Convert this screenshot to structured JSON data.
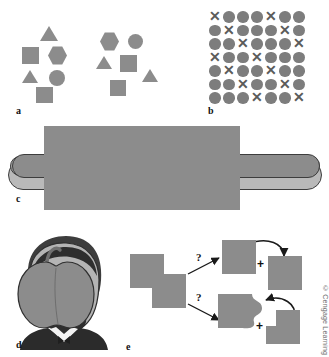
{
  "figure": {
    "credit": "© Cengage Learning",
    "shape_fill": "#8c8c8c",
    "outline": "#3d3d3d",
    "background": "#ffffff"
  },
  "panels": [
    {
      "id": "a",
      "label": "a",
      "name": "grouping-panel",
      "groups": [
        {
          "name": "left-cluster",
          "shapes": [
            "triangle",
            "square",
            "hexagon",
            "triangle",
            "circle",
            "square"
          ]
        },
        {
          "name": "right-cluster",
          "shapes": [
            "hexagon",
            "circle",
            "triangle",
            "square",
            "triangle",
            "square"
          ]
        }
      ]
    },
    {
      "id": "b",
      "label": "b",
      "name": "texture-segregation-panel",
      "grid": {
        "rows": 7,
        "cols": 7,
        "circle_symbol": "●",
        "cross_symbol": "✕",
        "cells": [
          [
            "X",
            "O",
            "O",
            "O",
            "X",
            "O",
            "O"
          ],
          [
            "O",
            "X",
            "O",
            "O",
            "O",
            "X",
            "O"
          ],
          [
            "O",
            "O",
            "X",
            "O",
            "O",
            "O",
            "X"
          ],
          [
            "X",
            "O",
            "O",
            "X",
            "O",
            "O",
            "O"
          ],
          [
            "O",
            "X",
            "O",
            "O",
            "X",
            "O",
            "O"
          ],
          [
            "O",
            "O",
            "X",
            "O",
            "O",
            "X",
            "O"
          ],
          [
            "O",
            "O",
            "O",
            "X",
            "O",
            "O",
            "X"
          ]
        ]
      }
    },
    {
      "id": "c",
      "label": "c",
      "name": "occlusion-hotdog-panel",
      "object": "hot-dog",
      "occluder": "gray-rectangle"
    },
    {
      "id": "d",
      "label": "d",
      "name": "occlusion-face-panel",
      "object": "lincoln-portrait",
      "occluder": "apple"
    },
    {
      "id": "e",
      "label": "e",
      "name": "ambiguous-overlap-panel",
      "stimulus": "two-overlapping-squares",
      "question_marks": [
        "?",
        "?"
      ],
      "plus_signs": [
        "+",
        "+"
      ],
      "interpretations": [
        {
          "name": "two-complete-squares",
          "description": "whole square plus occluded whole square"
        },
        {
          "name": "notched-square-and-L-shape",
          "description": "bitten square plus L-shaped piece"
        }
      ]
    }
  ]
}
